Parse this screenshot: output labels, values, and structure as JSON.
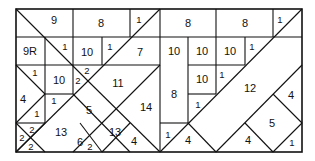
{
  "diagram": {
    "title": "",
    "frame_color": "#111111",
    "background": "#ffffff",
    "pieces": [
      {
        "id": "p9",
        "label": "9"
      },
      {
        "id": "p8a",
        "label": "8"
      },
      {
        "id": "p1a",
        "label": "1"
      },
      {
        "id": "p8b",
        "label": "8"
      },
      {
        "id": "p8c",
        "label": "8"
      },
      {
        "id": "p1b",
        "label": "1"
      },
      {
        "id": "p9R",
        "label": "9R"
      },
      {
        "id": "p1c",
        "label": "1"
      },
      {
        "id": "p10a",
        "label": "10"
      },
      {
        "id": "p1d",
        "label": "1"
      },
      {
        "id": "p7",
        "label": "7"
      },
      {
        "id": "p10b",
        "label": "10"
      },
      {
        "id": "p10c",
        "label": "10"
      },
      {
        "id": "p10d",
        "label": "10"
      },
      {
        "id": "p1e",
        "label": "1"
      },
      {
        "id": "p1f",
        "label": "1"
      },
      {
        "id": "p10e",
        "label": "10"
      },
      {
        "id": "p2a",
        "label": "2"
      },
      {
        "id": "p2b",
        "label": "2"
      },
      {
        "id": "p11",
        "label": "11"
      },
      {
        "id": "p10f",
        "label": "10"
      },
      {
        "id": "p1g",
        "label": "1"
      },
      {
        "id": "p12",
        "label": "12"
      },
      {
        "id": "p4a",
        "label": "4"
      },
      {
        "id": "p1h",
        "label": "1"
      },
      {
        "id": "p5a",
        "label": "5"
      },
      {
        "id": "p14",
        "label": "14"
      },
      {
        "id": "p8d",
        "label": "8"
      },
      {
        "id": "p1i",
        "label": "1"
      },
      {
        "id": "p4b",
        "label": "4"
      },
      {
        "id": "p1j",
        "label": "1"
      },
      {
        "id": "p2c",
        "label": "2"
      },
      {
        "id": "p2d",
        "label": "2"
      },
      {
        "id": "p2e",
        "label": "2"
      },
      {
        "id": "p13a",
        "label": "13"
      },
      {
        "id": "p6",
        "label": "6"
      },
      {
        "id": "p13b",
        "label": "13"
      },
      {
        "id": "p2f",
        "label": "2"
      },
      {
        "id": "p4c",
        "label": "4"
      },
      {
        "id": "p1k",
        "label": "1"
      },
      {
        "id": "p4d",
        "label": "4"
      },
      {
        "id": "p4e",
        "label": "4"
      },
      {
        "id": "p5b",
        "label": "5"
      },
      {
        "id": "p1l",
        "label": "1"
      }
    ]
  }
}
